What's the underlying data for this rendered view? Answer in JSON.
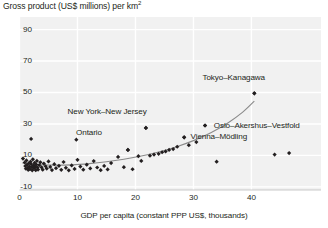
{
  "chart_data": {
    "type": "scatter",
    "title_main": "Gross product (US$ millions) per km",
    "title_sup": "2",
    "xlabel": "GDP per capita (constant PPP US$, thousands)",
    "ylabel": "",
    "xlim": [
      0,
      52
    ],
    "ylim": [
      -12,
      98
    ],
    "xticks": [
      0,
      10,
      20,
      30,
      40
    ],
    "xtick_labels": [
      "0",
      "10",
      "20",
      "30",
      "40"
    ],
    "yticks": [
      -10,
      10,
      30,
      50,
      70,
      90
    ],
    "ytick_labels": [
      "-10",
      "10",
      "30",
      "50",
      "70",
      "90"
    ],
    "grid": true,
    "grid_color": "#ffffff",
    "plot_bg": "#f1f1f1",
    "marker_color": "#231f20",
    "trend_color": "#8a8a8a",
    "legend": null,
    "annotations": [
      {
        "text": "New York–New Jersey",
        "x": 15.1,
        "y": 37.5,
        "anchor": "middle",
        "point_x": 21.8,
        "point_y": 27.5
      },
      {
        "text": "Ontario",
        "x": 12.0,
        "y": 24.0,
        "anchor": "middle",
        "point_x": 18.7,
        "point_y": 13.5
      },
      {
        "text": "Tokyo–Kanagawa",
        "x": 37.0,
        "y": 59.0,
        "anchor": "middle",
        "point_x": 40.5,
        "point_y": 49.5
      },
      {
        "text": "Oslo–Akershus–Vestfold",
        "x": 33.5,
        "y": 29.0,
        "anchor": "start",
        "point_x": 32.0,
        "point_y": 29.0
      },
      {
        "text": "Vienna–Mödling",
        "x": 29.5,
        "y": 21.5,
        "anchor": "start",
        "point_x": 28.4,
        "point_y": 21.5
      }
    ],
    "series": [
      {
        "name": "Regions",
        "points": [
          [
            0.6,
            8.0
          ],
          [
            0.9,
            5.5
          ],
          [
            1.0,
            3.2
          ],
          [
            1.1,
            1.5
          ],
          [
            1.2,
            6.8
          ],
          [
            1.3,
            4.0
          ],
          [
            1.4,
            2.0
          ],
          [
            1.5,
            0.8
          ],
          [
            1.6,
            5.0
          ],
          [
            1.7,
            3.0
          ],
          [
            1.8,
            1.2
          ],
          [
            1.9,
            6.0
          ],
          [
            2.0,
            4.5
          ],
          [
            2.1,
            2.5
          ],
          [
            2.2,
            0.5
          ],
          [
            2.3,
            7.5
          ],
          [
            2.4,
            3.5
          ],
          [
            2.5,
            1.8
          ],
          [
            2.6,
            5.2
          ],
          [
            2.7,
            2.8
          ],
          [
            2.8,
            0.6
          ],
          [
            2.9,
            4.2
          ],
          [
            3.0,
            6.5
          ],
          [
            3.1,
            2.2
          ],
          [
            3.2,
            1.0
          ],
          [
            3.4,
            3.8
          ],
          [
            3.6,
            5.6
          ],
          [
            3.8,
            2.4
          ],
          [
            4.0,
            0.9
          ],
          [
            4.2,
            4.8
          ],
          [
            4.5,
            3.1
          ],
          [
            4.7,
            1.6
          ],
          [
            5.0,
            6.2
          ],
          [
            5.3,
            2.7
          ],
          [
            5.6,
            0.7
          ],
          [
            6.0,
            4.4
          ],
          [
            6.3,
            1.9
          ],
          [
            6.8,
            3.4
          ],
          [
            7.2,
            0.8
          ],
          [
            7.6,
            5.8
          ],
          [
            8.0,
            2.1
          ],
          [
            8.5,
            0.5
          ],
          [
            9.0,
            3.6
          ],
          [
            9.5,
            1.4
          ],
          [
            10.0,
            7.2
          ],
          [
            10.5,
            2.9
          ],
          [
            11.0,
            0.9
          ],
          [
            11.6,
            4.1
          ],
          [
            12.2,
            1.7
          ],
          [
            12.8,
            6.4
          ],
          [
            13.4,
            2.3
          ],
          [
            14.0,
            0.6
          ],
          [
            14.6,
            3.3
          ],
          [
            15.2,
            1.1
          ],
          [
            15.8,
            5.1
          ],
          [
            2.0,
            20.5
          ],
          [
            9.8,
            20.0
          ],
          [
            17.0,
            9.0
          ],
          [
            18.0,
            2.5
          ],
          [
            18.7,
            13.5
          ],
          [
            19.5,
            1.2
          ],
          [
            20.5,
            9.5
          ],
          [
            21.0,
            6.5
          ],
          [
            21.8,
            27.5
          ],
          [
            22.5,
            9.8
          ],
          [
            23.2,
            10.5
          ],
          [
            24.0,
            11.0
          ],
          [
            24.6,
            12.0
          ],
          [
            25.2,
            12.5
          ],
          [
            25.8,
            13.5
          ],
          [
            26.5,
            14.0
          ],
          [
            27.2,
            15.5
          ],
          [
            28.4,
            21.5
          ],
          [
            29.2,
            16.5
          ],
          [
            30.5,
            18.5
          ],
          [
            32.0,
            29.0
          ],
          [
            34.0,
            6.0
          ],
          [
            40.5,
            49.5
          ],
          [
            44.0,
            10.5
          ],
          [
            46.5,
            11.5
          ]
        ]
      }
    ],
    "trend_line": [
      [
        0.5,
        5.2
      ],
      [
        3.0,
        4.2
      ],
      [
        6.0,
        3.8
      ],
      [
        9.0,
        4.0
      ],
      [
        12.0,
        4.8
      ],
      [
        15.0,
        6.0
      ],
      [
        18.0,
        7.6
      ],
      [
        21.0,
        9.6
      ],
      [
        24.0,
        12.2
      ],
      [
        27.0,
        15.4
      ],
      [
        30.0,
        19.4
      ],
      [
        33.0,
        24.4
      ],
      [
        36.0,
        30.8
      ],
      [
        38.5,
        37.5
      ],
      [
        40.5,
        44.5
      ]
    ]
  }
}
